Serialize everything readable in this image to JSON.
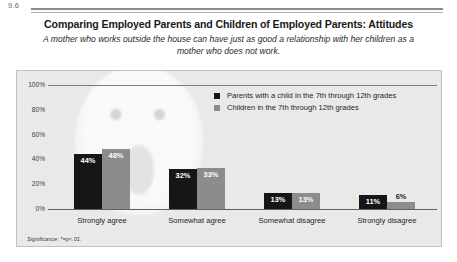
{
  "figure": {
    "number": "9.6",
    "title": "Comparing Employed Parents and Children of Employed Parents: Attitudes",
    "subtitle": "A mother who works outside the house can have just as good a relationship with her children as a mother who does not work.",
    "note": "Significance: *=p<.01."
  },
  "chart_data": {
    "type": "bar",
    "title": "Comparing Employed Parents and Children of Employed Parents: Attitudes",
    "subtitle": "A mother who works outside the house can have just as good a relationship with her children as a mother who does not work.",
    "categories": [
      "Strongly agree",
      "Somewhat agree",
      "Somewhat disagree",
      "Strongly disagree"
    ],
    "series": [
      {
        "name": "Parents with a child in the 7th through 12th grades",
        "color": "#161616",
        "values": [
          44,
          48,
          13,
          11
        ],
        "labels": [
          "44%",
          "32%",
          "13%",
          "11%"
        ]
      },
      {
        "name": "Children in the 7th through 12th grades",
        "color": "#8c8c8c",
        "values": [
          48,
          33,
          13,
          6
        ],
        "labels": [
          "48%",
          "33%",
          "13%",
          "6%"
        ]
      }
    ],
    "groups": [
      {
        "category": "Strongly agree",
        "bars": [
          {
            "series": "Parents with a child in the 7th through 12th grades",
            "value": 44,
            "label": "44%"
          },
          {
            "series": "Children in the 7th through 12th grades",
            "value": 48,
            "label": "48%"
          }
        ]
      },
      {
        "category": "Somewhat agree",
        "bars": [
          {
            "series": "Parents with a child in the 7th through 12th grades",
            "value": 32,
            "label": "32%"
          },
          {
            "series": "Children in the 7th through 12th grades",
            "value": 33,
            "label": "33%"
          }
        ]
      },
      {
        "category": "Somewhat disagree",
        "bars": [
          {
            "series": "Parents with a child in the 7th through 12th grades",
            "value": 13,
            "label": "13%"
          },
          {
            "series": "Children in the 7th through 12th grades",
            "value": 13,
            "label": "13%"
          }
        ]
      },
      {
        "category": "Strongly disagree",
        "bars": [
          {
            "series": "Parents with a child in the 7th through 12th grades",
            "value": 11,
            "label": "11%"
          },
          {
            "series": "Children in the 7th through 12th grades",
            "value": 6,
            "label": "6%"
          }
        ]
      }
    ],
    "xlabel": "",
    "ylabel": "",
    "ylim": [
      0,
      100
    ],
    "yticks": [
      0,
      20,
      40,
      60,
      80,
      100
    ],
    "ytick_labels": [
      "0%",
      "20%",
      "40%",
      "60%",
      "80%",
      "100%"
    ],
    "grid": false,
    "legend_position": "top-right",
    "annotations": [
      "Significance: *=p<.01."
    ]
  }
}
